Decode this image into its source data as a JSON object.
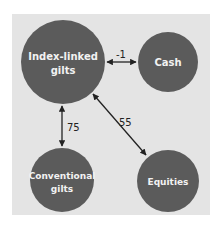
{
  "diagram": {
    "type": "correlation-network",
    "colors": {
      "background": "#e4e4e4",
      "node_fill": "#5b5b5b",
      "node_text": "#f2f2f2",
      "edge": "#222222"
    },
    "nodes": [
      {
        "id": "ilg",
        "label_lines": [
          "Index-linked",
          "gilts"
        ],
        "cx": 63,
        "cy": 62,
        "r": 42
      },
      {
        "id": "cash",
        "label_lines": [
          "Cash"
        ],
        "cx": 168,
        "cy": 62,
        "r": 30
      },
      {
        "id": "conv",
        "label_lines": [
          "Conventional",
          "gilts"
        ],
        "cx": 62,
        "cy": 180,
        "r": 32
      },
      {
        "id": "eq",
        "label_lines": [
          "Equities"
        ],
        "cx": 168,
        "cy": 181,
        "r": 31
      }
    ],
    "edges": [
      {
        "from": "ilg",
        "to": "cash",
        "label": "-1"
      },
      {
        "from": "ilg",
        "to": "conv",
        "label": "75"
      },
      {
        "from": "ilg",
        "to": "eq",
        "label": "55"
      }
    ]
  }
}
